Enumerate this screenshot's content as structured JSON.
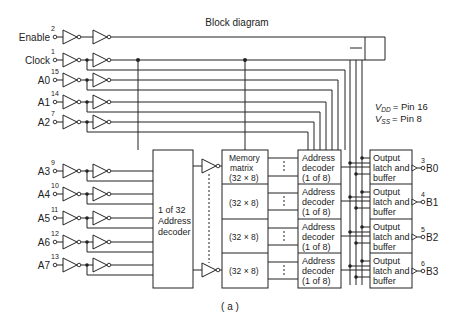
{
  "title": "Block diagram",
  "caption": "( a )",
  "power_note": {
    "vdd": {
      "label": "V",
      "sub": "DD",
      "value": "= Pin 16"
    },
    "vss": {
      "label": "V",
      "sub": "SS",
      "value": "= Pin 8"
    }
  },
  "inputs": [
    {
      "name": "Enable",
      "pin": "2"
    },
    {
      "name": "Clock",
      "pin": "1"
    },
    {
      "name": "A0",
      "pin": "15"
    },
    {
      "name": "A1",
      "pin": "14"
    },
    {
      "name": "A2",
      "pin": "7"
    },
    {
      "name": "A3",
      "pin": "9"
    },
    {
      "name": "A4",
      "pin": "10"
    },
    {
      "name": "A5",
      "pin": "11"
    },
    {
      "name": "A6",
      "pin": "12"
    },
    {
      "name": "A7",
      "pin": "13"
    }
  ],
  "blocks": {
    "decoder32": {
      "line1": "1 of 32",
      "line2": "Address",
      "line3": "decoder"
    },
    "memory": {
      "line1": "Memory",
      "line2": "matrix",
      "cell": "(32 × 8)"
    },
    "addr_decoder": {
      "line1": "Address",
      "line2": "decoder",
      "line3": "(1 of 8)"
    },
    "output_latch": {
      "line1": "Output",
      "line2": "latch and",
      "line3": "buffer"
    }
  },
  "outputs": [
    {
      "name": "B0",
      "pin": "3"
    },
    {
      "name": "B1",
      "pin": "4"
    },
    {
      "name": "B2",
      "pin": "5"
    },
    {
      "name": "B3",
      "pin": "6"
    }
  ]
}
